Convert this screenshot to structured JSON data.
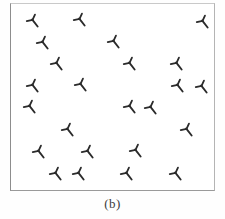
{
  "figure": {
    "caption": "(b)",
    "caption_top": 196,
    "caption_font_size": 13,
    "panel_width": 225,
    "panel_height": 219,
    "background_color": "#ffffff"
  },
  "box": {
    "left": 10,
    "top": 3,
    "width": 205,
    "height": 188,
    "border_color": "#9a9a9a",
    "fill_color": "#ffffff"
  },
  "chart_data": {
    "type": "scatter",
    "title": "",
    "subtitle": "",
    "xlabel": "",
    "ylabel": "",
    "grid": false,
    "legend": null,
    "marker": "arrow-tack-glyph",
    "marker_color": "#2b2b2b",
    "marker_size": 13,
    "point_count": 25,
    "xlim": [
      10,
      215
    ],
    "ylim": [
      3,
      191
    ],
    "axis_ticks": [],
    "annotations": [],
    "points": [
      {
        "x": 33,
        "y": 21,
        "rotation": -38
      },
      {
        "x": 80,
        "y": 20,
        "rotation": -38
      },
      {
        "x": 203,
        "y": 22,
        "rotation": -38
      },
      {
        "x": 43,
        "y": 43,
        "rotation": -38
      },
      {
        "x": 114,
        "y": 42,
        "rotation": -38
      },
      {
        "x": 57,
        "y": 64,
        "rotation": -38
      },
      {
        "x": 130,
        "y": 64,
        "rotation": -38
      },
      {
        "x": 177,
        "y": 64,
        "rotation": -38
      },
      {
        "x": 33,
        "y": 86,
        "rotation": -38
      },
      {
        "x": 81,
        "y": 85,
        "rotation": -38
      },
      {
        "x": 178,
        "y": 86,
        "rotation": -38
      },
      {
        "x": 202,
        "y": 87,
        "rotation": -38
      },
      {
        "x": 30,
        "y": 107,
        "rotation": -38
      },
      {
        "x": 130,
        "y": 107,
        "rotation": -38
      },
      {
        "x": 151,
        "y": 108,
        "rotation": -38
      },
      {
        "x": 68,
        "y": 130,
        "rotation": -38
      },
      {
        "x": 187,
        "y": 130,
        "rotation": -38
      },
      {
        "x": 39,
        "y": 152,
        "rotation": -38
      },
      {
        "x": 88,
        "y": 152,
        "rotation": -38
      },
      {
        "x": 136,
        "y": 151,
        "rotation": -38
      },
      {
        "x": 56,
        "y": 174,
        "rotation": -38
      },
      {
        "x": 79,
        "y": 174,
        "rotation": -38
      },
      {
        "x": 127,
        "y": 174,
        "rotation": -38
      },
      {
        "x": 176,
        "y": 174,
        "rotation": -38
      }
    ]
  }
}
